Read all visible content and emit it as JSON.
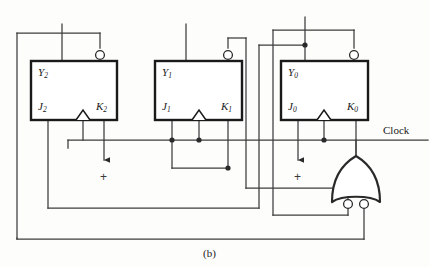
{
  "figure": {
    "caption": "(b)",
    "type": "logic-circuit-schematic"
  },
  "flipflops": [
    {
      "id": "ff2",
      "state_label": "Y",
      "state_sub": "2",
      "j_label": "J",
      "j_sub": "2",
      "k_label": "K",
      "k_sub": "2",
      "box": {
        "x": 31,
        "y": 61,
        "w": 86,
        "h": 59
      }
    },
    {
      "id": "ff1",
      "state_label": "Y",
      "state_sub": "1",
      "j_label": "J",
      "j_sub": "1",
      "k_label": "K",
      "k_sub": "1",
      "box": {
        "x": 155,
        "y": 61,
        "w": 87,
        "h": 59
      }
    },
    {
      "id": "ff0",
      "state_label": "Y",
      "state_sub": "0",
      "j_label": "J",
      "j_sub": "0",
      "k_label": "K",
      "k_sub": "0",
      "box": {
        "x": 281,
        "y": 61,
        "w": 87,
        "h": 59
      }
    }
  ],
  "signals": {
    "clock_label": "Clock",
    "power_symbol": "+",
    "power_markers": 2
  },
  "gate": {
    "name": "or-gate-inverted-inputs",
    "inputs": 2,
    "bubbles": 2,
    "orientation": "up"
  },
  "colors": {
    "wire": "#3c3c3c",
    "box_border": "#1a1a1a",
    "ink": "#1a1a1a",
    "background": "#fdfdfb"
  }
}
